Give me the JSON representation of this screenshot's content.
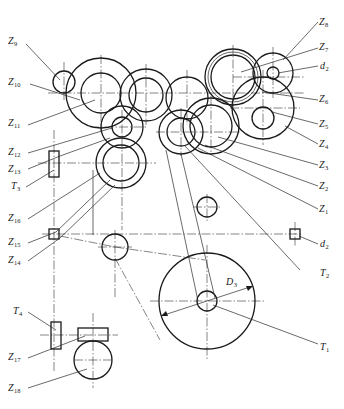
{
  "diagram": {
    "type": "gear-transmission-schematic",
    "stroke_color": "#1a1a1a",
    "background": "#ffffff",
    "labels": [
      {
        "id": "Z9",
        "base": "Z",
        "sub": "9",
        "x": 8,
        "y": 40
      },
      {
        "id": "Z10",
        "base": "Z",
        "sub": "10",
        "x": 8,
        "y": 81
      },
      {
        "id": "Z11",
        "base": "Z",
        "sub": "11",
        "x": 8,
        "y": 121
      },
      {
        "id": "Z12",
        "base": "Z",
        "sub": "12",
        "x": 8,
        "y": 150
      },
      {
        "id": "Z13",
        "base": "Z",
        "sub": "13",
        "x": 8,
        "y": 167
      },
      {
        "id": "T3",
        "base": "T",
        "sub": "3",
        "x": 10,
        "y": 184
      },
      {
        "id": "Z16",
        "base": "Z",
        "sub": "16",
        "x": 8,
        "y": 216
      },
      {
        "id": "Z15",
        "base": "Z",
        "sub": "15",
        "x": 8,
        "y": 240
      },
      {
        "id": "Z14",
        "base": "Z",
        "sub": "14",
        "x": 8,
        "y": 258
      },
      {
        "id": "T4",
        "base": "T",
        "sub": "4",
        "x": 12,
        "y": 309
      },
      {
        "id": "Z17",
        "base": "Z",
        "sub": "17",
        "x": 8,
        "y": 354
      },
      {
        "id": "Z18",
        "base": "Z",
        "sub": "18",
        "x": 8,
        "y": 386
      },
      {
        "id": "Z8",
        "base": "Z",
        "sub": "8",
        "x": 319,
        "y": 20
      },
      {
        "id": "Z7",
        "base": "Z",
        "sub": "7",
        "x": 319,
        "y": 45
      },
      {
        "id": "d2_top",
        "base": "d",
        "sub": "2",
        "x": 319,
        "y": 64
      },
      {
        "id": "Z6",
        "base": "Z",
        "sub": "6",
        "x": 319,
        "y": 97
      },
      {
        "id": "Z5",
        "base": "Z",
        "sub": "5",
        "x": 319,
        "y": 122
      },
      {
        "id": "Z4",
        "base": "Z",
        "sub": "4",
        "x": 319,
        "y": 142
      },
      {
        "id": "Z3",
        "base": "Z",
        "sub": "3",
        "x": 319,
        "y": 163
      },
      {
        "id": "Z2",
        "base": "Z",
        "sub": "2",
        "x": 319,
        "y": 184
      },
      {
        "id": "Z1",
        "base": "Z",
        "sub": "1",
        "x": 319,
        "y": 207
      },
      {
        "id": "d2_right",
        "base": "d",
        "sub": "2",
        "x": 320,
        "y": 242
      },
      {
        "id": "T2",
        "base": "T",
        "sub": "2",
        "x": 320,
        "y": 271
      },
      {
        "id": "T1",
        "base": "T",
        "sub": "1",
        "x": 320,
        "y": 345
      },
      {
        "id": "D3",
        "base": "D",
        "sub": "3",
        "x": 226,
        "y": 280
      }
    ]
  }
}
